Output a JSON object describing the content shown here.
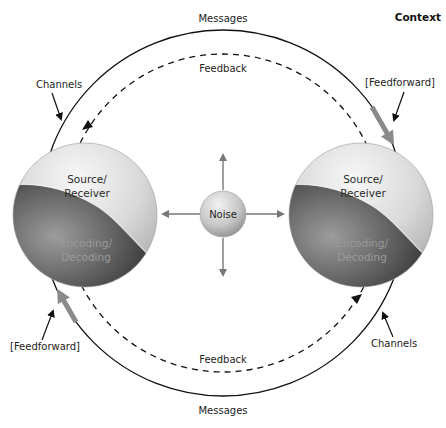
{
  "title": "Context",
  "outer_loop": {
    "top_label": "Messages",
    "bottom_label": "Messages"
  },
  "inner_loop": {
    "top_label": "Feedback",
    "bottom_label": "Feedback"
  },
  "annotations": {
    "channels_left": "Channels",
    "channels_right": "Channels",
    "feedforward_right": "[Feedforward]",
    "feedforward_left": "[Feedforward]"
  },
  "left_sphere": {
    "top_line1": "Source/",
    "top_line2": "Receiver",
    "bottom_line1": "Encoding/",
    "bottom_line2": "Decoding"
  },
  "right_sphere": {
    "top_line1": "Source/",
    "top_line2": "Receiver",
    "bottom_line1": "Encoding/",
    "bottom_line2": "Decoding"
  },
  "noise": {
    "label": "Noise"
  },
  "colors": {
    "line": "#111111",
    "feedforward_arrow": "#8a8a8a",
    "noise_arrow": "#777777",
    "sphere_light": "#e6e6e6",
    "sphere_dark": "#3a3a3a"
  }
}
